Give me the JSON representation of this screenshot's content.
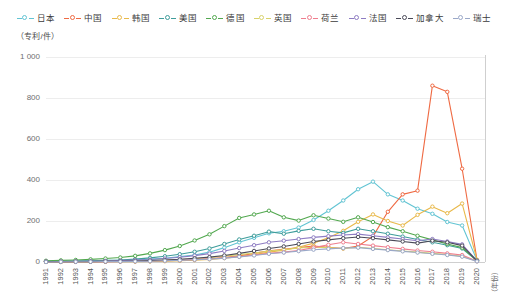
{
  "unit_label_y": "（专利/件）",
  "unit_label_x": "（年份）",
  "chart_data": {
    "type": "line",
    "title": "",
    "xlabel": "（年份）",
    "ylabel": "（专利/件）",
    "ylim": [
      0,
      1000
    ],
    "yticks": [
      "0",
      "200",
      "400",
      "600",
      "800",
      "1 000"
    ],
    "ytick_values": [
      0,
      200,
      400,
      600,
      800,
      1000
    ],
    "grid": true,
    "legend_position": "top-center",
    "categories": [
      "1991",
      "1992",
      "1993",
      "1994",
      "1995",
      "1996",
      "1997",
      "1998",
      "1999",
      "2000",
      "2001",
      "2002",
      "2003",
      "2004",
      "2005",
      "2006",
      "2007",
      "2008",
      "2009",
      "2010",
      "2011",
      "2012",
      "2013",
      "2014",
      "2015",
      "2016",
      "2017",
      "2018",
      "2019",
      "2020"
    ],
    "series": [
      {
        "name": "日本",
        "color": "#62c4d3",
        "values": [
          4,
          4,
          5,
          6,
          7,
          8,
          10,
          14,
          18,
          26,
          34,
          48,
          70,
          96,
          118,
          140,
          150,
          168,
          205,
          250,
          300,
          355,
          392,
          330,
          300,
          260,
          235,
          195,
          178,
          8
        ]
      },
      {
        "name": "中国",
        "color": "#ef6a43",
        "values": [
          1,
          1,
          1,
          2,
          2,
          3,
          3,
          4,
          6,
          8,
          11,
          16,
          22,
          30,
          42,
          55,
          62,
          70,
          78,
          72,
          66,
          78,
          125,
          245,
          330,
          348,
          860,
          830,
          455,
          10
        ]
      },
      {
        "name": "韩国",
        "color": "#e9b94a",
        "values": [
          0,
          0,
          1,
          1,
          1,
          2,
          2,
          3,
          4,
          6,
          9,
          13,
          19,
          26,
          36,
          48,
          58,
          72,
          92,
          118,
          152,
          196,
          232,
          200,
          178,
          230,
          270,
          238,
          285,
          10
        ]
      },
      {
        "name": "美国",
        "color": "#3f9d9b",
        "values": [
          3,
          4,
          5,
          6,
          8,
          10,
          14,
          20,
          28,
          38,
          50,
          66,
          88,
          110,
          128,
          148,
          138,
          152,
          162,
          150,
          142,
          162,
          150,
          138,
          124,
          110,
          96,
          82,
          66,
          6
        ]
      },
      {
        "name": "德国",
        "color": "#52a84f",
        "values": [
          6,
          8,
          10,
          13,
          17,
          22,
          30,
          42,
          58,
          78,
          105,
          135,
          175,
          215,
          232,
          250,
          218,
          202,
          228,
          212,
          196,
          218,
          195,
          170,
          150,
          128,
          108,
          88,
          70,
          6
        ]
      },
      {
        "name": "英国",
        "color": "#d8d26a",
        "values": [
          1,
          1,
          2,
          2,
          3,
          4,
          5,
          7,
          9,
          12,
          16,
          21,
          28,
          36,
          44,
          54,
          60,
          68,
          72,
          70,
          66,
          72,
          66,
          60,
          54,
          48,
          42,
          36,
          28,
          4
        ]
      },
      {
        "name": "荷兰",
        "color": "#ef7e8e",
        "values": [
          1,
          1,
          1,
          2,
          2,
          3,
          4,
          5,
          7,
          9,
          12,
          16,
          21,
          27,
          34,
          42,
          48,
          56,
          70,
          84,
          96,
          88,
          80,
          72,
          64,
          56,
          50,
          42,
          34,
          4
        ]
      },
      {
        "name": "法国",
        "color": "#8e7cc3",
        "values": [
          2,
          2,
          3,
          4,
          5,
          7,
          9,
          12,
          17,
          23,
          31,
          41,
          54,
          68,
          82,
          96,
          104,
          112,
          120,
          126,
          132,
          136,
          128,
          120,
          112,
          104,
          112,
          100,
          86,
          6
        ]
      },
      {
        "name": "加拿大",
        "color": "#4a4a58",
        "values": [
          1,
          1,
          2,
          2,
          3,
          4,
          5,
          7,
          10,
          13,
          18,
          24,
          32,
          42,
          54,
          66,
          76,
          88,
          100,
          108,
          116,
          122,
          116,
          108,
          100,
          92,
          104,
          96,
          80,
          5
        ]
      },
      {
        "name": "瑞士",
        "color": "#9aa8c8",
        "values": [
          0,
          1,
          1,
          1,
          2,
          2,
          3,
          4,
          6,
          8,
          11,
          14,
          19,
          25,
          32,
          40,
          46,
          53,
          60,
          64,
          68,
          70,
          64,
          58,
          52,
          46,
          40,
          34,
          26,
          3
        ]
      }
    ]
  }
}
